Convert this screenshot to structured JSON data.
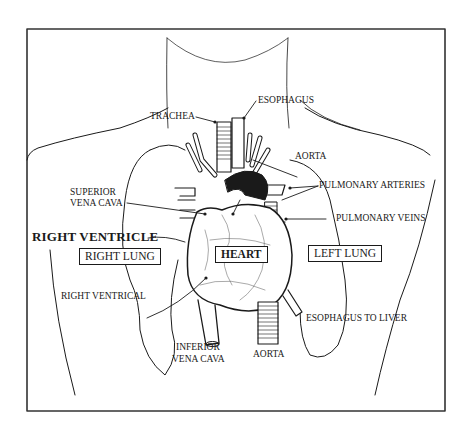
{
  "diagram": {
    "colors": {
      "ink": "#1a1a1a",
      "background": "#ffffff",
      "frame": "#333333"
    },
    "labels": {
      "trachea": "TRACHEA",
      "esophagus": "ESOPHAGUS",
      "aorta_top": "AORTA",
      "pulmonary_arteries": "PULMONARY ARTERIES",
      "pulmonary_veins": "PULMONARY VEINS",
      "superior_vena_cava_line1": "SUPERIOR",
      "superior_vena_cava_line2": "VENA CAVA",
      "right_ventricle": "RIGHT VENTRICLE",
      "right_lung": "RIGHT LUNG",
      "heart": "HEART",
      "left_lung": "LEFT LUNG",
      "right_ventrical": "RIGHT VENTRICAL",
      "esophagus_to_liver": "ESOPHAGUS TO LIVER",
      "inferior_vena_cava_line1": "INFERIOR",
      "inferior_vena_cava_line2": "VENA CAVA",
      "aorta_bottom": "AORTA"
    }
  }
}
